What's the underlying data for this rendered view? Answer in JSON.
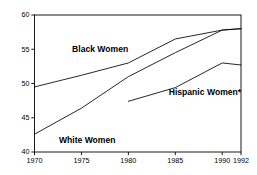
{
  "chart_data": {
    "type": "line",
    "title": "",
    "subtitle": "",
    "xlabel": "",
    "ylabel": "",
    "xlim": [
      1970,
      1992
    ],
    "ylim": [
      40,
      60
    ],
    "grid": false,
    "legend_position": "inline-annotations",
    "x_ticks": [
      1970,
      1975,
      1980,
      1985,
      1990,
      1992
    ],
    "x_tick_labels": [
      "1970",
      "1975",
      "1980",
      "1985",
      "1990",
      "1992"
    ],
    "y_ticks": [
      40,
      45,
      50,
      55,
      60
    ],
    "y_tick_labels": [
      "40",
      "45",
      "50",
      "55",
      "60"
    ],
    "series": [
      {
        "name": "Black Women",
        "label": "Black Women",
        "label_x": 1974.0,
        "label_y": 54.6,
        "x": [
          1970,
          1975,
          1980,
          1985,
          1990,
          1992
        ],
        "values": [
          49.5,
          51.2,
          53.0,
          56.5,
          57.8,
          58.0
        ]
      },
      {
        "name": "White Women",
        "label": "White Women",
        "label_x": 1972.6,
        "label_y": 41.3,
        "x": [
          1970,
          1975,
          1980,
          1985,
          1990,
          1992
        ],
        "values": [
          42.6,
          46.4,
          51.0,
          54.5,
          57.8,
          58.0
        ]
      },
      {
        "name": "Hispanic Women*",
        "label": "Hispanic Women*",
        "label_x": 1984.3,
        "label_y": 48.3,
        "x": [
          1980,
          1985,
          1990,
          1992
        ],
        "values": [
          47.4,
          49.4,
          53.0,
          52.7
        ]
      }
    ],
    "annotations": [
      "*"
    ],
    "colors": {
      "line": "#000000",
      "axis": "#000000",
      "background": "#ffffff"
    }
  }
}
